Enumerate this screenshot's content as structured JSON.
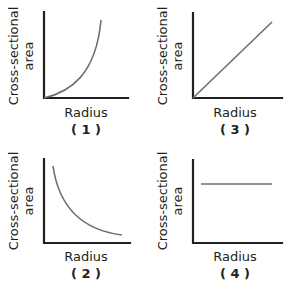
{
  "figure": {
    "panels": [
      {
        "id": "1",
        "xlabel": "Radius",
        "ylabel_line1": "Cross-sectional",
        "ylabel_line2": "area",
        "caption": "( 1 )",
        "shape": "increasing-exponential"
      },
      {
        "id": "2",
        "xlabel": "Radius",
        "ylabel_line1": "Cross-sectional",
        "ylabel_line2": "area",
        "caption": "( 2 )",
        "shape": "decreasing-inverse"
      },
      {
        "id": "3",
        "xlabel": "Radius",
        "ylabel_line1": "Cross-sectional",
        "ylabel_line2": "area",
        "caption": "( 3 )",
        "shape": "linear-increasing"
      },
      {
        "id": "4",
        "xlabel": "Radius",
        "ylabel_line1": "Cross-sectional",
        "ylabel_line2": "area",
        "caption": "( 4 )",
        "shape": "constant"
      }
    ],
    "colors": {
      "axis": "#231f20",
      "curve": "#6d6e71"
    }
  }
}
